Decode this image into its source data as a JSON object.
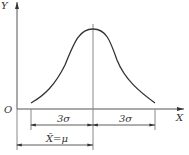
{
  "diagram": {
    "axes": {
      "y_label": "Y",
      "x_label": "X",
      "origin_label": "O"
    },
    "dimensions": {
      "left_span": "3σ",
      "right_span": "3σ",
      "mean_span": "X̄=μ"
    },
    "colors": {
      "line": "#333333",
      "guide": "#888888"
    }
  }
}
